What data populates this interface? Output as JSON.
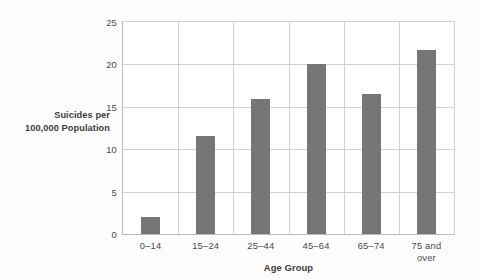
{
  "chart_data": {
    "type": "bar",
    "title": "",
    "xlabel": "Age Group",
    "ylabel_line1": "Suicides per",
    "ylabel_line2": "100,000 Population",
    "ylabel": "Suicides per 100,000 Population",
    "categories": [
      "0–14",
      "15–24",
      "25–44",
      "45–64",
      "65–74",
      "75 and\nover"
    ],
    "values": [
      2.0,
      11.5,
      15.9,
      20.0,
      16.5,
      21.7
    ],
    "yticks": [
      0,
      5,
      10,
      15,
      20,
      25
    ],
    "ytick_labels": [
      "0",
      "5",
      "10",
      "15",
      "20",
      "25"
    ],
    "ylim": [
      0,
      25
    ],
    "grid": "both",
    "legend": "none",
    "bar_color": "#767676",
    "grid_color": "#d2d2d2",
    "axis_color": "#b9b9b9",
    "background": "#fdfdfd",
    "plot_background": "#ffffff"
  }
}
